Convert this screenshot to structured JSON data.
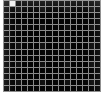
{
  "figure": {
    "kind": "grid-lattice-pattern",
    "columns": 16,
    "rows": 15,
    "cell_pitch_px": 6,
    "gridline_width_px": 1,
    "panel": {
      "left_px": 3,
      "top_px": 0,
      "width_px": 98,
      "height_px": 92
    },
    "margins": {
      "left_px": 3,
      "right_px": 3,
      "top_px": 0,
      "bottom_px": 8
    },
    "colors": {
      "background": "#ffffff",
      "cell": "#050505",
      "cell_dim": "#111111",
      "gridline": "#8a8a8a",
      "highlight_cell": "#f2f2f2"
    },
    "highlight": {
      "present": true,
      "label": "bright cell",
      "column_index": 1,
      "row_index": 0
    }
  }
}
